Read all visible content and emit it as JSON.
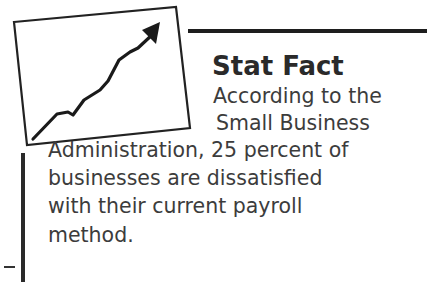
{
  "sidebar": {
    "title": "Stat Fact",
    "icon": "rising-chart-icon",
    "body_lines": [
      "According to the",
      "Small Business",
      "Administration, 25 percent of",
      "businesses are dissatisfied",
      "with their current payroll",
      "method."
    ],
    "colors": {
      "text": "#3c3c3c",
      "rule": "#1e1e1e",
      "background": "#ffffff"
    }
  }
}
